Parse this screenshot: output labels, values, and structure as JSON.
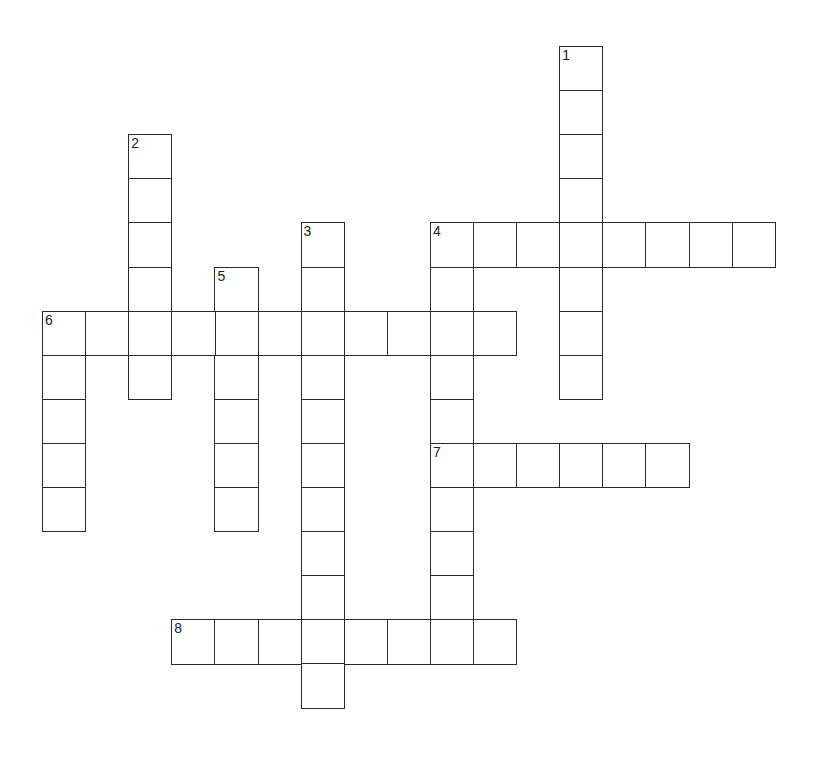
{
  "puzzle": {
    "type": "crossword",
    "grid_origin": {
      "x": 42,
      "y": 46
    },
    "cell_pitch": {
      "x": 43.1,
      "y": 44.1
    },
    "border_color": "#2a2a2a",
    "background_color": "#ffffff",
    "entries": [
      {
        "number": "1",
        "direction": "down",
        "row": 0,
        "col": 12,
        "length": 8
      },
      {
        "number": "2",
        "direction": "down",
        "row": 2,
        "col": 2,
        "length": 6
      },
      {
        "number": "3",
        "direction": "down",
        "row": 4,
        "col": 6,
        "length": 11
      },
      {
        "number": "4",
        "direction": "across",
        "row": 4,
        "col": 9,
        "length": 8
      },
      {
        "number": "4",
        "direction": "down",
        "row": 4,
        "col": 9,
        "length": 9
      },
      {
        "number": "5",
        "direction": "down",
        "row": 5,
        "col": 4,
        "length": 6
      },
      {
        "number": "6",
        "direction": "across",
        "row": 6,
        "col": 0,
        "length": 11
      },
      {
        "number": "6",
        "direction": "down",
        "row": 6,
        "col": 0,
        "length": 5
      },
      {
        "number": "7",
        "direction": "across",
        "row": 9,
        "col": 9,
        "length": 6
      },
      {
        "number": "8",
        "direction": "across",
        "row": 13,
        "col": 3,
        "length": 8
      }
    ],
    "clue_numbers": [
      {
        "number": "1",
        "row": 0,
        "col": 12
      },
      {
        "number": "2",
        "row": 2,
        "col": 2
      },
      {
        "number": "3",
        "row": 4,
        "col": 6
      },
      {
        "number": "4",
        "row": 4,
        "col": 9
      },
      {
        "number": "5",
        "row": 5,
        "col": 4
      },
      {
        "number": "6",
        "row": 6,
        "col": 0
      },
      {
        "number": "7",
        "row": 9,
        "col": 9
      },
      {
        "number": "8",
        "row": 13,
        "col": 3
      }
    ]
  }
}
